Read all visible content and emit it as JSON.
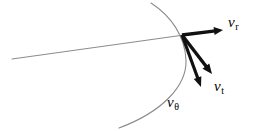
{
  "figure": {
    "background_color": "#ffffff",
    "width": 259,
    "height": 131,
    "origin": {
      "x": 182,
      "y": 35
    },
    "labels": [
      {
        "id": "v_r",
        "name": "radial-velocity-label",
        "symbol": "v",
        "subscript": "r",
        "x": 228,
        "y": 15
      },
      {
        "id": "v_t",
        "name": "tangential-velocity-label",
        "symbol": "v",
        "subscript": "t",
        "x": 214,
        "y": 79
      },
      {
        "id": "v_theta",
        "name": "theta-velocity-label",
        "symbol": "v",
        "subscript": "θ",
        "x": 167,
        "y": 95
      }
    ],
    "vectors": [
      {
        "id": "v_r",
        "name": "radial-velocity-arrow",
        "from": {
          "x": 182,
          "y": 35
        },
        "to": {
          "x": 223,
          "y": 30
        },
        "color": "#111111",
        "stroke_width": 3.4,
        "head_length": 9,
        "head_width": 8
      },
      {
        "id": "v_t",
        "name": "tangential-velocity-arrow",
        "from": {
          "x": 182,
          "y": 35
        },
        "to": {
          "x": 212,
          "y": 74
        },
        "color": "#111111",
        "stroke_width": 3.4,
        "head_length": 10,
        "head_width": 8.5
      },
      {
        "id": "v_theta",
        "name": "theta-velocity-arrow",
        "from": {
          "x": 182,
          "y": 35
        },
        "to": {
          "x": 201,
          "y": 87
        },
        "color": "#111111",
        "stroke_width": 3.2,
        "head_length": 10,
        "head_width": 8
      }
    ],
    "curves": [
      {
        "id": "orbit-arc",
        "name": "orbit-arc-curve",
        "kind": "arc",
        "path": "M 151 3 C 171 16, 185 36, 186 60 C 187 86, 162 112, 119 128",
        "color": "#8c8c8c",
        "stroke_width": 1.1
      },
      {
        "id": "radius-line",
        "name": "radial-line",
        "kind": "line",
        "path": "M 12 59 L 184 35",
        "color": "#8c8c8c",
        "stroke_width": 1.1
      }
    ]
  }
}
